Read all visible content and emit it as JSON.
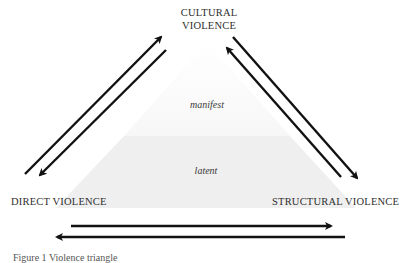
{
  "diagram": {
    "title": "Violence triangle",
    "nodes": {
      "top": {
        "line1": "CULTURAL",
        "line2": "VIOLENCE"
      },
      "left": {
        "label": "DIRECT VIOLENCE"
      },
      "right": {
        "label": "STRUCTURAL VIOLENCE"
      }
    },
    "layers": {
      "upper": "manifest",
      "lower": "latent"
    },
    "edges": [
      {
        "from": "DIRECT VIOLENCE",
        "to": "CULTURAL VIOLENCE",
        "direction": "bidirectional"
      },
      {
        "from": "CULTURAL VIOLENCE",
        "to": "STRUCTURAL VIOLENCE",
        "direction": "bidirectional"
      },
      {
        "from": "DIRECT VIOLENCE",
        "to": "STRUCTURAL VIOLENCE",
        "direction": "bidirectional"
      }
    ],
    "caption": "Figure 1  Violence triangle",
    "colors": {
      "arrow": "#111111",
      "upper_fill": "#fbfbfb",
      "lower_fill": "#efefef",
      "text": "#2e2e2e"
    }
  }
}
